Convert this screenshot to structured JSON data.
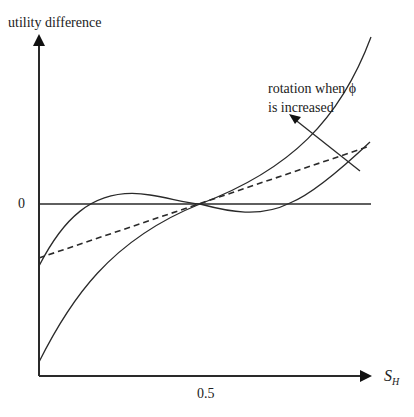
{
  "diagram": {
    "y_axis_label": "utility difference",
    "x_axis_label_main": "S",
    "x_axis_label_sub": "H",
    "y_tick_zero": "0",
    "x_tick_half": "0.5",
    "annotation_line1": "rotation when ϕ",
    "annotation_line2": "is increased",
    "colors": {
      "stroke": "#2a2a2a",
      "background": "#ffffff"
    },
    "curves": [
      {
        "name": "steep-convex-curve",
        "style": "solid",
        "description": "rises from bottom-left, through crossing point, steeply up to top-right"
      },
      {
        "name": "s-shaped-curve",
        "style": "solid",
        "description": "starts below zero at left, rises above zero, dips below zero after crossing point, rises at right"
      },
      {
        "name": "linear-dashed-line",
        "style": "dashed",
        "description": "straight line from left below zero through crossing point to upper right"
      }
    ]
  }
}
